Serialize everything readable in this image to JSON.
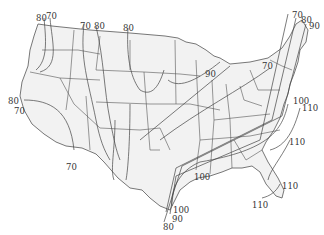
{
  "map": {
    "type": "isoline map",
    "region": "Contiguous United States",
    "line_color": "#555555",
    "land_color": "#f2f2f2",
    "background_color": "#ffffff",
    "contour_labels": [
      {
        "id": "nw-80",
        "text": "80",
        "x": 36,
        "y": 14
      },
      {
        "id": "nw-70",
        "text": "70",
        "x": 46,
        "y": 12
      },
      {
        "id": "n-70",
        "text": "70",
        "x": 80,
        "y": 22
      },
      {
        "id": "n-80",
        "text": "80",
        "x": 94,
        "y": 22
      },
      {
        "id": "n-80b",
        "text": "80",
        "x": 123,
        "y": 24
      },
      {
        "id": "w-80",
        "text": "80",
        "x": 8,
        "y": 97
      },
      {
        "id": "w-70",
        "text": "70",
        "x": 14,
        "y": 107
      },
      {
        "id": "sw-70",
        "text": "70",
        "x": 66,
        "y": 163
      },
      {
        "id": "gl-90",
        "text": "90",
        "x": 205,
        "y": 70
      },
      {
        "id": "ne-70",
        "text": "70",
        "x": 262,
        "y": 62
      },
      {
        "id": "ne-top-70",
        "text": "70",
        "x": 292,
        "y": 11
      },
      {
        "id": "ne-top-80",
        "text": "80",
        "x": 301,
        "y": 16
      },
      {
        "id": "ne-top-90",
        "text": "90",
        "x": 309,
        "y": 22
      },
      {
        "id": "e-100",
        "text": "100",
        "x": 293,
        "y": 97
      },
      {
        "id": "e-110",
        "text": "110",
        "x": 302,
        "y": 104
      },
      {
        "id": "se-110",
        "text": "110",
        "x": 289,
        "y": 138
      },
      {
        "id": "gulf-100",
        "text": "100",
        "x": 194,
        "y": 173
      },
      {
        "id": "fl-110",
        "text": "110",
        "x": 282,
        "y": 182
      },
      {
        "id": "fl-110b",
        "text": "110",
        "x": 252,
        "y": 201
      },
      {
        "id": "tx-100",
        "text": "100",
        "x": 173,
        "y": 206
      },
      {
        "id": "tx-90",
        "text": "90",
        "x": 172,
        "y": 215
      },
      {
        "id": "tx-80",
        "text": "80",
        "x": 163,
        "y": 223
      }
    ]
  }
}
